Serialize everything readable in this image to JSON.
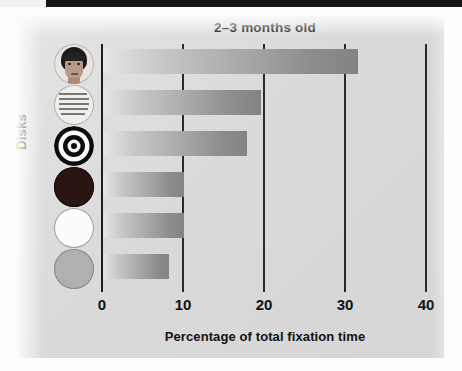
{
  "figure": {
    "title": "2–3 months old",
    "y_axis_label": "Disks",
    "x_axis_label": "Percentage of total fixation time"
  },
  "chart_data": {
    "type": "bar",
    "orientation": "horizontal",
    "title": "2–3 months old",
    "xlabel": "Percentage of total fixation time",
    "ylabel": "Disks",
    "xlim": [
      0,
      40
    ],
    "xticks": [
      0,
      10,
      20,
      30,
      40
    ],
    "xtick_labels": [
      "0",
      "10",
      "20",
      "30",
      "40"
    ],
    "grid": true,
    "legend": "none",
    "categories": [
      "face photograph disk",
      "newsprint disk",
      "bullseye disk",
      "red disk",
      "white disk",
      "yellow disk"
    ],
    "values": [
      31.5,
      19.5,
      17.8,
      10.0,
      10.0,
      8.2
    ],
    "bars": [
      {
        "category": "face photograph disk",
        "icon": "face-disk-icon",
        "value": 31.5
      },
      {
        "category": "newsprint disk",
        "icon": "newsprint-disk-icon",
        "value": 19.5
      },
      {
        "category": "bullseye disk",
        "icon": "bullseye-disk-icon",
        "value": 17.8
      },
      {
        "category": "red disk",
        "icon": "red-disk-icon",
        "value": 10.0
      },
      {
        "category": "white disk",
        "icon": "white-disk-icon",
        "value": 10.0
      },
      {
        "category": "yellow disk",
        "icon": "yellow-disk-icon",
        "value": 8.2
      }
    ],
    "colors": {
      "bar_gradient_start": "#e6e6e6",
      "bar_gradient_end": "#838383",
      "panel_background": "#dcdcdc",
      "axis": "#2a2a2a",
      "text": "#121212"
    }
  }
}
